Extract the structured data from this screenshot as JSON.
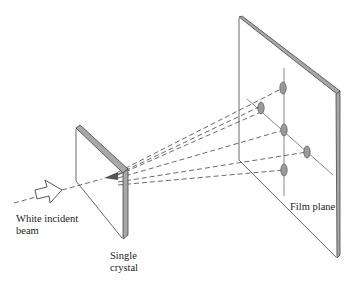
{
  "diagram": {
    "type": "laue-diffraction-setup",
    "labels": {
      "beam": "White incident\nbeam",
      "crystal": "Single\ncrystal",
      "film": "Film plane"
    },
    "colors": {
      "line": "#444444",
      "edge_fill": "#a8a8a8",
      "spot_fill": "#9a9a9a",
      "background": "#ffffff"
    },
    "components": [
      {
        "name": "incident-beam-arrow",
        "style": "hollow-arrow"
      },
      {
        "name": "single-crystal",
        "style": "thin-slab"
      },
      {
        "name": "film-plane",
        "style": "thin-slab"
      },
      {
        "name": "diffracted-beams",
        "count": 5,
        "style": "dashed"
      },
      {
        "name": "laue-spots",
        "count": 5
      }
    ],
    "spots": [
      {
        "x": 283,
        "y": 88
      },
      {
        "x": 261,
        "y": 108
      },
      {
        "x": 284,
        "y": 130
      },
      {
        "x": 307,
        "y": 152
      },
      {
        "x": 284,
        "y": 170
      }
    ]
  }
}
